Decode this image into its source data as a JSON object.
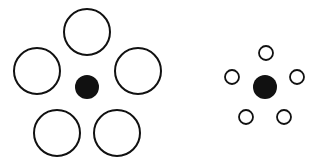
{
  "figure": {
    "colors": {
      "stroke": "#111111",
      "fill": "#111111",
      "background": "#ffffff"
    },
    "groups": [
      {
        "name": "large-surround",
        "center": {
          "cx": 87,
          "cy": 87,
          "r": 12
        },
        "surround_r": 23,
        "surround": [
          {
            "cx": 87,
            "cy": 32
          },
          {
            "cx": 37,
            "cy": 71
          },
          {
            "cx": 138,
            "cy": 71
          },
          {
            "cx": 57,
            "cy": 133
          },
          {
            "cx": 117,
            "cy": 133
          }
        ]
      },
      {
        "name": "small-surround",
        "center": {
          "cx": 265,
          "cy": 87,
          "r": 12
        },
        "surround_r": 7,
        "surround": [
          {
            "cx": 266,
            "cy": 53
          },
          {
            "cx": 232,
            "cy": 77
          },
          {
            "cx": 297,
            "cy": 77
          },
          {
            "cx": 246,
            "cy": 117
          },
          {
            "cx": 284,
            "cy": 117
          }
        ]
      }
    ]
  }
}
